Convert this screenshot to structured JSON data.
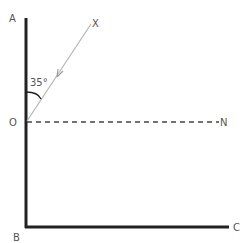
{
  "diagram": {
    "labels": {
      "A": "A",
      "B": "B",
      "C": "C",
      "O": "O",
      "N": "N",
      "X": "X"
    },
    "angle_label": "35°",
    "colors": {
      "axis": "#222222",
      "ray": "#b0b0b0",
      "dashed": "#444444",
      "text": "#555555"
    }
  }
}
